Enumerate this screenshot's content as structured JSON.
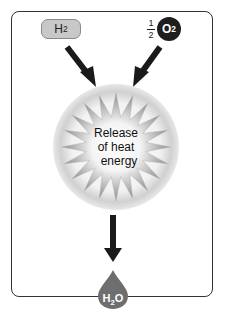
{
  "diagram": {
    "reactants": [
      {
        "id": "h2",
        "label": "H",
        "subscript": "2",
        "coefficient": ""
      },
      {
        "id": "o2",
        "label": "O",
        "subscript": "2",
        "coefficient_num": "1",
        "coefficient_den": "2"
      }
    ],
    "process": {
      "lines": [
        "Release",
        "of heat",
        "energy"
      ]
    },
    "product": {
      "label": "H",
      "subscript": "2",
      "suffix": "O"
    },
    "colors": {
      "h2_fill": "#c8c8c8",
      "o2_fill": "#1e1e1e",
      "arrow": "#1a1a1a",
      "burst": "#9a9a9a",
      "glow": "#d8d8d8",
      "water_drop": "#6e6e6e"
    }
  }
}
